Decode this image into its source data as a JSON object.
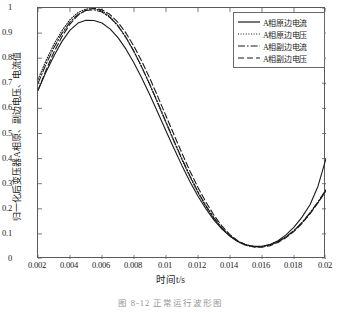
{
  "chart_data": {
    "type": "line",
    "title": "",
    "xlabel": "时间t/s",
    "ylabel": "归一化后变压器A相原、副边电压、电流值",
    "caption": "图 8-12  正常运行波形图",
    "xlim": [
      0.002,
      0.02
    ],
    "ylim": [
      0,
      1
    ],
    "xticks": [
      "0.002",
      "0.004",
      "0.006",
      "0.008",
      "0.01",
      "0.012",
      "0.014",
      "0.016",
      "0.018",
      "0.02"
    ],
    "xtick_values": [
      0.002,
      0.004,
      0.006,
      0.008,
      0.01,
      0.012,
      0.014,
      0.016,
      0.018,
      0.02
    ],
    "yticks": [
      "0",
      "0.1",
      "0.2",
      "0.3",
      "0.4",
      "0.5",
      "0.6",
      "0.7",
      "0.8",
      "0.9",
      "1"
    ],
    "ytick_values": [
      0,
      0.1,
      0.2,
      0.3,
      0.4,
      0.5,
      0.6,
      0.7,
      0.8,
      0.9,
      1
    ],
    "grid": false,
    "legend_position": "top-right",
    "x": [
      0.002,
      0.0025,
      0.003,
      0.0035,
      0.004,
      0.0045,
      0.005,
      0.0055,
      0.006,
      0.0065,
      0.007,
      0.0075,
      0.008,
      0.0085,
      0.009,
      0.0095,
      0.01,
      0.0105,
      0.011,
      0.0115,
      0.012,
      0.0125,
      0.013,
      0.0135,
      0.014,
      0.0145,
      0.015,
      0.0155,
      0.016,
      0.0165,
      0.017,
      0.0175,
      0.018,
      0.0185,
      0.019,
      0.0195,
      0.02
    ],
    "series": [
      {
        "name": "A相原边电流",
        "style": "solid",
        "color": "#1a1a1a",
        "values": [
          0.672,
          0.745,
          0.81,
          0.867,
          0.912,
          0.94,
          0.951,
          0.95,
          0.94,
          0.917,
          0.882,
          0.836,
          0.781,
          0.719,
          0.652,
          0.582,
          0.51,
          0.44,
          0.372,
          0.308,
          0.25,
          0.199,
          0.155,
          0.119,
          0.091,
          0.07,
          0.057,
          0.051,
          0.051,
          0.058,
          0.073,
          0.096,
          0.127,
          0.167,
          0.216,
          0.29,
          0.4
        ]
      },
      {
        "name": "A相原边电压",
        "style": "dotted",
        "color": "#1a1a1a",
        "values": [
          0.715,
          0.79,
          0.856,
          0.91,
          0.954,
          0.982,
          0.996,
          0.998,
          0.988,
          0.965,
          0.93,
          0.883,
          0.826,
          0.762,
          0.692,
          0.618,
          0.543,
          0.468,
          0.395,
          0.327,
          0.264,
          0.208,
          0.16,
          0.121,
          0.09,
          0.068,
          0.054,
          0.048,
          0.049,
          0.056,
          0.069,
          0.087,
          0.112,
          0.144,
          0.182,
          0.225,
          0.272
        ]
      },
      {
        "name": "A相副边电流",
        "style": "dashdot",
        "color": "#1a1a1a",
        "values": [
          0.7,
          0.776,
          0.843,
          0.899,
          0.944,
          0.974,
          0.99,
          0.993,
          0.984,
          0.962,
          0.928,
          0.882,
          0.827,
          0.763,
          0.694,
          0.621,
          0.546,
          0.471,
          0.399,
          0.331,
          0.268,
          0.212,
          0.164,
          0.124,
          0.093,
          0.07,
          0.056,
          0.05,
          0.05,
          0.057,
          0.07,
          0.089,
          0.114,
          0.146,
          0.184,
          0.228,
          0.276
        ]
      },
      {
        "name": "A相副边电压",
        "style": "dashed",
        "color": "#1a1a1a",
        "values": [
          0.672,
          0.752,
          0.825,
          0.886,
          0.936,
          0.971,
          0.992,
          0.999,
          0.993,
          0.974,
          0.943,
          0.9,
          0.847,
          0.786,
          0.718,
          0.645,
          0.57,
          0.495,
          0.421,
          0.35,
          0.285,
          0.226,
          0.174,
          0.131,
          0.097,
          0.072,
          0.056,
          0.048,
          0.047,
          0.053,
          0.066,
          0.085,
          0.11,
          0.142,
          0.18,
          0.224,
          0.272
        ]
      }
    ]
  }
}
